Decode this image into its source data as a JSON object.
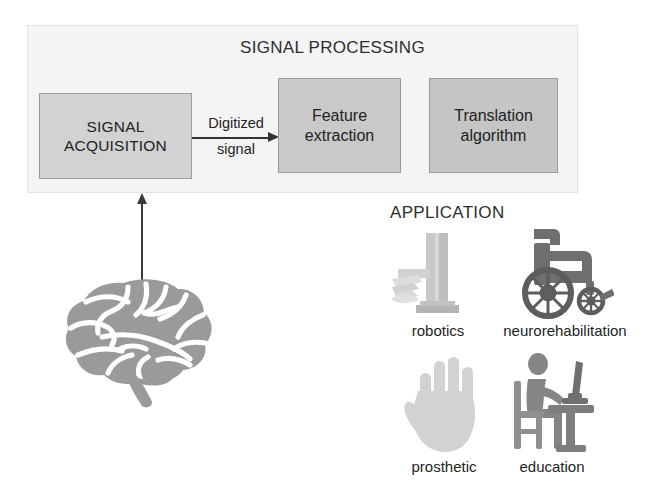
{
  "signal_processing": {
    "title": "SIGNAL PROCESSING",
    "boxes": [
      {
        "id": "signal-acquisition",
        "line1": "SIGNAL",
        "line2": "ACQUISITION",
        "fill": "#d2d2d2"
      },
      {
        "id": "feature-extraction",
        "line1": "Feature",
        "line2": "extraction",
        "fill": "#c9c9c9"
      },
      {
        "id": "translation-algorithm",
        "line1": "Translation",
        "line2": "algorithm",
        "fill": "#c5c5c5"
      }
    ],
    "connector": {
      "label_top": "Digitized",
      "label_bottom": "signal",
      "direction": "right",
      "icon": "arrow-right-icon"
    },
    "panel_fill": "#f4f4f4",
    "border_color": "#9b9b9b"
  },
  "brain": {
    "icon": "brain-icon",
    "fill": "#9a9a9a",
    "arrow_icon": "arrow-up-icon",
    "arrow_color": "#3a3a3a"
  },
  "application": {
    "title": "APPLICATION",
    "items": [
      {
        "label": "robotics",
        "icon": "robot-arm-icon",
        "fill": "#c4c4c4"
      },
      {
        "label": "neurorehabilitation",
        "icon": "wheelchair-icon",
        "fill": "#6f6f6f"
      },
      {
        "label": "prosthetic",
        "icon": "hand-icon",
        "fill": "#cfcfcf"
      },
      {
        "label": "education",
        "icon": "person-desk-icon",
        "fill": "#858585"
      }
    ]
  }
}
